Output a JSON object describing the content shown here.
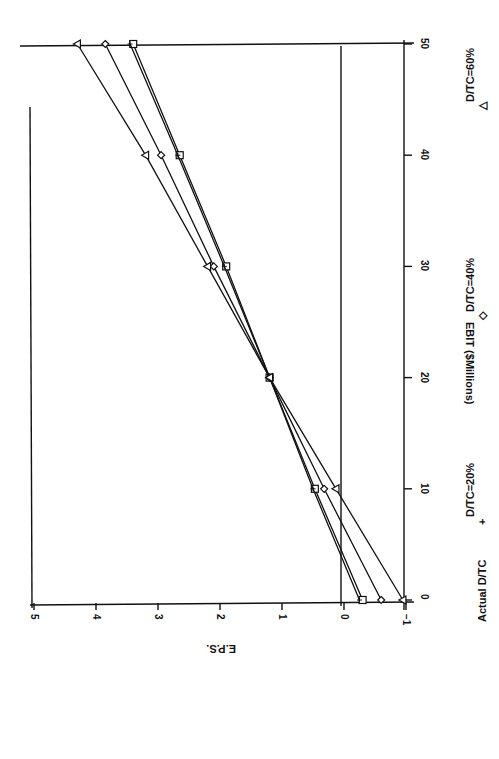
{
  "chart_data": {
    "type": "line",
    "orientation": "rotated-90-clockwise",
    "title": "",
    "xlabel": "EBIT ($Millions)",
    "ylabel": "E.P.S.",
    "x": [
      0,
      10,
      20,
      30,
      40,
      50
    ],
    "xlim": [
      0,
      50
    ],
    "ylim": [
      -1,
      5
    ],
    "x_ticks": [
      "0",
      "10",
      "20",
      "30",
      "40",
      "50"
    ],
    "y_ticks": [
      "-1",
      "0",
      "1",
      "2",
      "3",
      "4",
      "5"
    ],
    "grid": false,
    "reference_line": {
      "eps": 0
    },
    "legend_position": "bottom",
    "series": [
      {
        "name": "Actual D/TC",
        "marker": "square",
        "values": [
          -0.3,
          0.47,
          1.2,
          1.9,
          2.65,
          3.4
        ]
      },
      {
        "name": "D/TC=20%",
        "marker": "plus",
        "values": [
          -0.25,
          0.5,
          1.2,
          1.93,
          2.68,
          3.45
        ]
      },
      {
        "name": "D/TC=40%",
        "marker": "diamond",
        "values": [
          -0.6,
          0.32,
          1.2,
          2.1,
          2.95,
          3.85
        ]
      },
      {
        "name": "D/TC=60%",
        "marker": "triangle",
        "values": [
          -0.95,
          0.13,
          1.2,
          2.2,
          3.2,
          4.3
        ]
      }
    ]
  },
  "labels": {
    "xlabel": "EBIT ($Millions)",
    "ylabel": "E.P.S.",
    "legend_title": "Actual D/TC",
    "legend": [
      {
        "symbol": "+",
        "text": "D/TC=20%"
      },
      {
        "symbol": "◇",
        "text": "D/TC=40%"
      },
      {
        "symbol": "△",
        "text": "D/TC=60%"
      }
    ]
  },
  "colors": {
    "ink": "#111111",
    "background": "#ffffff"
  }
}
